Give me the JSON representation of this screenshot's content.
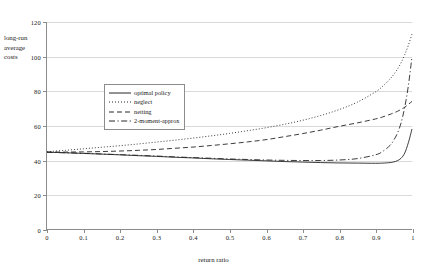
{
  "chart_data": {
    "type": "line",
    "title": "",
    "xlabel": "return ratio",
    "ylabel": "long-run average costs",
    "xlim": [
      0,
      1
    ],
    "ylim": [
      0,
      120
    ],
    "grid": true,
    "legend_position": "upper-left-inside",
    "xticks": [
      "0",
      "0.1",
      "0.2",
      "0.3",
      "0.4",
      "0.5",
      "0.6",
      "0.7",
      "0.8",
      "0.9",
      "1"
    ],
    "xtick_values": [
      0,
      0.1,
      0.2,
      0.3,
      0.4,
      0.5,
      0.6,
      0.7,
      0.8,
      0.9,
      1
    ],
    "yticks": [
      "0",
      "20",
      "40",
      "60",
      "80",
      "100",
      "120"
    ],
    "ytick_values": [
      0,
      20,
      40,
      60,
      80,
      100,
      120
    ],
    "x": [
      0,
      0.05,
      0.1,
      0.15,
      0.2,
      0.25,
      0.3,
      0.35,
      0.4,
      0.45,
      0.5,
      0.55,
      0.6,
      0.65,
      0.7,
      0.75,
      0.8,
      0.85,
      0.9,
      0.92,
      0.94,
      0.95,
      0.96,
      0.97,
      0.98,
      0.99,
      1
    ],
    "series": [
      {
        "name": "optimal policy",
        "style": "solid",
        "values": [
          44.5,
          44.2,
          43.8,
          43.4,
          43.0,
          42.5,
          42.1,
          41.6,
          41.2,
          40.7,
          40.3,
          39.9,
          39.5,
          39.1,
          38.8,
          38.5,
          38.3,
          38.2,
          38.1,
          38.2,
          38.5,
          38.9,
          39.6,
          41.0,
          44.0,
          50.0,
          58.0
        ]
      },
      {
        "name": "neglect",
        "style": "dotted",
        "values": [
          44.8,
          45.6,
          46.5,
          47.4,
          48.3,
          49.3,
          50.4,
          51.5,
          52.7,
          54.0,
          55.4,
          57.0,
          58.7,
          60.7,
          63.0,
          65.8,
          69.2,
          73.5,
          79.5,
          82.8,
          87.0,
          89.6,
          92.6,
          96.3,
          101.0,
          106.5,
          113.0
        ]
      },
      {
        "name": "netting",
        "style": "dashed",
        "values": [
          44.6,
          44.6,
          44.7,
          44.9,
          45.2,
          45.6,
          46.1,
          46.8,
          47.5,
          48.4,
          49.4,
          50.5,
          51.8,
          53.5,
          55.3,
          57.3,
          59.5,
          61.5,
          63.8,
          65.0,
          66.5,
          67.3,
          68.2,
          69.3,
          70.6,
          72.2,
          74.0
        ]
      },
      {
        "name": "2-moment-approx",
        "style": "dash-dot",
        "values": [
          44.5,
          44.2,
          43.9,
          43.5,
          43.1,
          42.7,
          42.3,
          41.8,
          41.4,
          41.0,
          40.6,
          40.3,
          40.0,
          39.8,
          39.7,
          39.7,
          40.0,
          40.8,
          43.0,
          45.0,
          48.5,
          51.5,
          55.5,
          61.5,
          70.5,
          83.0,
          100.0
        ]
      }
    ]
  },
  "legend": {
    "items": [
      {
        "label": "optimal policy",
        "style": "solid"
      },
      {
        "label": "neglect",
        "style": "dotted"
      },
      {
        "label": "netting",
        "style": "dashed"
      },
      {
        "label": "2-moment-approx",
        "style": "dash-dot"
      }
    ]
  },
  "axes": {
    "ylabel_line1": "long-run",
    "ylabel_line2": "average",
    "ylabel_line3": "costs",
    "xlabel": "return ratio"
  }
}
